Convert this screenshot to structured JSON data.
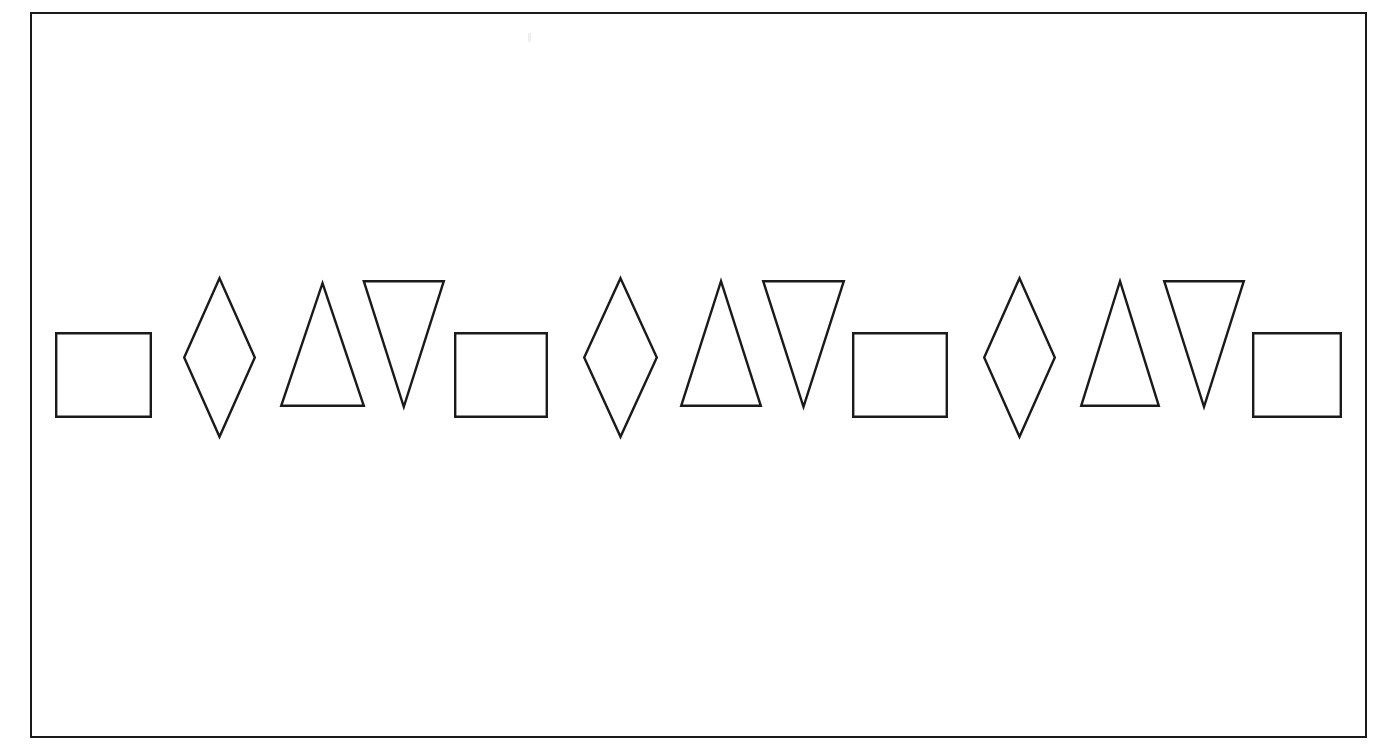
{
  "figure": {
    "background_color": "#ffffff",
    "stroke_color": "#1a1a1a",
    "fill_color": "#ffffff",
    "stroke_width": 2.4,
    "frame": {
      "x": 30,
      "y": 12,
      "width": 1337,
      "height": 726,
      "border_color": "#1a1a1a",
      "border_width": 2
    },
    "canvas": {
      "width": 1391,
      "height": 756
    }
  },
  "pattern": {
    "unit": [
      "square",
      "diamond",
      "triangle-up",
      "triangle-down"
    ],
    "repeats": 4,
    "total_shapes": 16,
    "baseline_y": 375
  },
  "shapes": [
    {
      "index": 1,
      "type": "square",
      "label": "square-1",
      "x": 55,
      "y": 332,
      "width": 97,
      "height": 86,
      "cx": 103.5,
      "cy": 375
    },
    {
      "index": 2,
      "type": "diamond",
      "label": "diamond-1",
      "x": 183,
      "y": 277,
      "width": 73,
      "height": 161,
      "cx": 219.5,
      "cy": 357.5
    },
    {
      "index": 3,
      "type": "triangle-up",
      "label": "triangle-up-1",
      "x": 280,
      "y": 282,
      "width": 85,
      "height": 125,
      "cx": 322.5,
      "cy": 344.5
    },
    {
      "index": 4,
      "type": "triangle-down",
      "label": "triangle-down-1",
      "x": 362,
      "y": 280,
      "width": 83,
      "height": 128,
      "cx": 403.5,
      "cy": 344
    },
    {
      "index": 5,
      "type": "square",
      "label": "square-2",
      "x": 454,
      "y": 332,
      "width": 94,
      "height": 86,
      "cx": 501,
      "cy": 375
    },
    {
      "index": 6,
      "type": "diamond",
      "label": "diamond-2",
      "x": 583,
      "y": 277,
      "width": 75,
      "height": 161,
      "cx": 620.5,
      "cy": 357.5
    },
    {
      "index": 7,
      "type": "triangle-up",
      "label": "triangle-up-2",
      "x": 680,
      "y": 280,
      "width": 82,
      "height": 127,
      "cx": 721,
      "cy": 343.5
    },
    {
      "index": 8,
      "type": "triangle-down",
      "label": "triangle-down-2",
      "x": 762,
      "y": 280,
      "width": 83,
      "height": 128,
      "cx": 803.5,
      "cy": 344
    },
    {
      "index": 9,
      "type": "square",
      "label": "square-3",
      "x": 852,
      "y": 332,
      "width": 96,
      "height": 86,
      "cx": 900,
      "cy": 375
    },
    {
      "index": 10,
      "type": "diamond",
      "label": "diamond-3",
      "x": 983,
      "y": 277,
      "width": 73,
      "height": 161,
      "cx": 1019.5,
      "cy": 357.5
    },
    {
      "index": 11,
      "type": "triangle-up",
      "label": "triangle-up-3",
      "x": 1080,
      "y": 280,
      "width": 80,
      "height": 127,
      "cx": 1120,
      "cy": 343.5
    },
    {
      "index": 12,
      "type": "triangle-down",
      "label": "triangle-down-3",
      "x": 1163,
      "y": 280,
      "width": 82,
      "height": 128,
      "cx": 1204,
      "cy": 344
    },
    {
      "index": 13,
      "type": "square",
      "label": "square-4",
      "x": 1252,
      "y": 332,
      "width": 90,
      "height": 86,
      "cx": 1297,
      "cy": 375
    }
  ],
  "paths": {
    "square_1": "M 56.2 333.2 L 150.8 333.2 L 150.8 416.8 L 56.2 416.8 Z",
    "diamond_1": "M 219.5 278.2 L 254.8 357.5 L 219.5 436.8 L 184.2 357.5 Z",
    "triangle_up_1": "M 322.5 283.2 L 363.8 405.8 L 281.2 405.8 Z",
    "triangle_down_1": "M 363.2 281.2 L 403.5 406.8 L 363.2 281.2 L 281.2 281.2 Z",
    "triangle_down_1b": "M 363.8 281.2 L 443.8 281.2 L 403.8 406.8 Z",
    "square_2": "M 455.2 333.2 L 546.8 333.2 L 546.8 416.8 L 455.2 416.8 Z",
    "diamond_2": "M 620.5 278.2 L 656.8 357.5 L 620.5 436.8 L 584.2 357.5 Z",
    "triangle_up_2": "M 721 281.2 L 760.8 405.8 L 681.2 405.8 Z",
    "triangle_down_2": "M 763.2 281.2 L 843.8 281.2 L 803.5 406.8 Z",
    "square_3": "M 853.2 333.2 L 946.8 333.2 L 946.8 416.8 L 853.2 416.8 Z",
    "diamond_3": "M 1019.5 278.2 L 1054.8 357.5 L 1019.5 436.8 L 984.2 357.5 Z",
    "triangle_up_3": "M 1120 281.2 L 1158.8 405.8 L 1081.2 405.8 Z",
    "triangle_down_3": "M 1164.2 281.2 L 1243.8 281.2 L 1204 406.8 Z",
    "square_4": "M 1253.2 333.2 L 1340.8 333.2 L 1340.8 416.8 L 1253.2 416.8 Z"
  }
}
